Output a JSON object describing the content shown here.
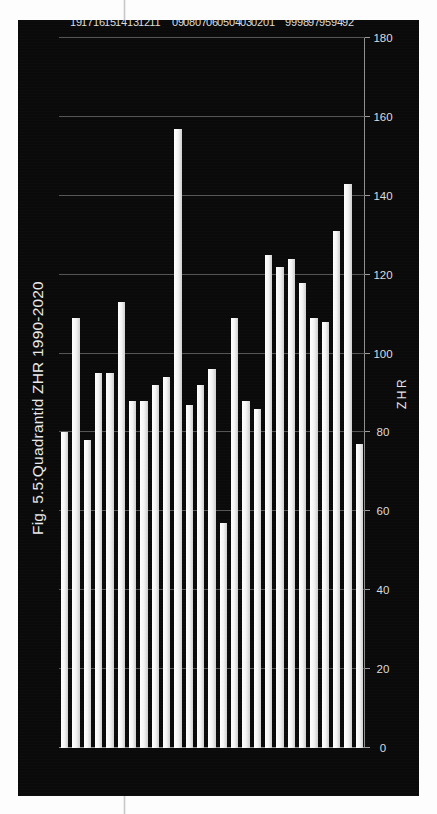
{
  "figure": {
    "title": "Fig. 5.5:Quadrantid ZHR 1990-2020"
  },
  "chart_data": {
    "type": "bar",
    "orientation": "horizontal",
    "title": "Fig. 5.5:Quadrantid ZHR 1990-2020",
    "xlabel": "ZHR",
    "ylabel": "Year",
    "xlim": [
      0,
      180
    ],
    "xticks": [
      0,
      20,
      40,
      60,
      80,
      100,
      120,
      140,
      160,
      180
    ],
    "xtick_labels": [
      "0",
      "20",
      "40",
      "60",
      "80",
      "100",
      "120",
      "140",
      "160",
      "180"
    ],
    "grid": true,
    "legend": "none",
    "axis_direction": "value axis increases to the left; category axis top-to-bottom newest-to-oldest",
    "categories": [
      "2020",
      "19",
      "17",
      "16",
      "15",
      "14",
      "13",
      "12",
      "11",
      "2010",
      "09",
      "08",
      "07",
      "06",
      "05",
      "04",
      "03",
      "02",
      "01",
      "2000",
      "99",
      "98",
      "97",
      "95",
      "94",
      "92",
      "1990"
    ],
    "values": [
      80,
      109,
      78,
      95,
      95,
      113,
      88,
      88,
      92,
      94,
      157,
      87,
      92,
      96,
      57,
      109,
      88,
      86,
      125,
      122,
      124,
      118,
      109,
      108,
      131,
      143,
      77
    ],
    "bar_color": "#f2f2f2",
    "background_color": "#0a0a0a"
  }
}
